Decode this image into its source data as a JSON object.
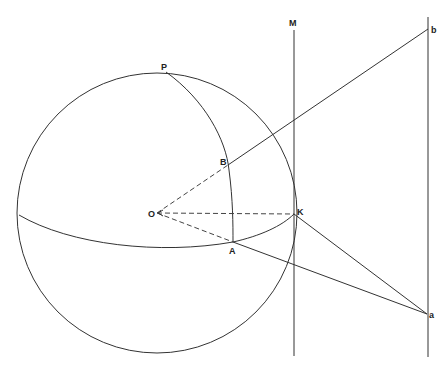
{
  "diagram": {
    "type": "spherical-projection-geometry",
    "labels": {
      "P": "P",
      "M": "M",
      "b": "b",
      "B": "B",
      "O": "O",
      "K": "K",
      "A": "A",
      "a": "a"
    },
    "points": {
      "O": [
        157,
        213
      ],
      "P": [
        166,
        72
      ],
      "B": [
        228,
        165
      ],
      "A": [
        233,
        242
      ],
      "K": [
        294,
        214
      ],
      "b": [
        428,
        29
      ],
      "a": [
        427,
        314
      ]
    },
    "sphere": {
      "cx": 157,
      "cy": 213,
      "r": 140
    },
    "colors": {
      "stroke": "#333333",
      "background": "#ffffff"
    }
  }
}
